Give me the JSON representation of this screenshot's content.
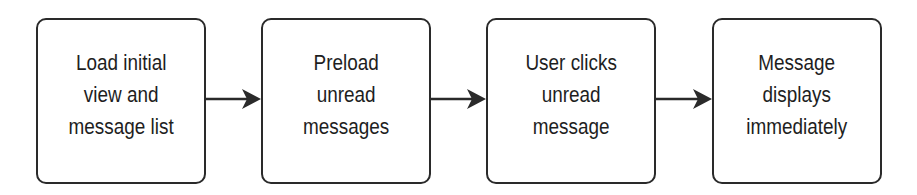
{
  "diagram": {
    "type": "flowchart",
    "direction": "left-to-right",
    "steps": [
      {
        "id": "step1",
        "label": "Load initial\nview and\nmessage list"
      },
      {
        "id": "step2",
        "label": "Preload\nunread\nmessages"
      },
      {
        "id": "step3",
        "label": "User clicks\nunread\nmessage"
      },
      {
        "id": "step4",
        "label": "Message\ndisplays\nimmediately"
      }
    ],
    "edges": [
      {
        "from": "step1",
        "to": "step2"
      },
      {
        "from": "step2",
        "to": "step3"
      },
      {
        "from": "step3",
        "to": "step4"
      }
    ],
    "colors": {
      "stroke": "#2a2a2a",
      "text": "#1e1e1e",
      "background": "#ffffff"
    }
  }
}
